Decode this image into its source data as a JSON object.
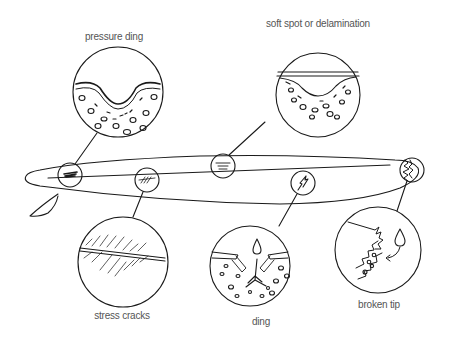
{
  "diagram": {
    "callouts": [
      {
        "id": "pressure-ding",
        "label": "pressure ding",
        "label_x": 114,
        "label_y": 31,
        "circle": {
          "cx": 118,
          "cy": 92,
          "r": 45
        },
        "board_point": {
          "cx": 70,
          "cy": 175
        }
      },
      {
        "id": "soft-spot",
        "label": "soft spot or delamination",
        "label_x": 318,
        "label_y": 18,
        "circle": {
          "cx": 318,
          "cy": 95,
          "r": 42
        },
        "board_point": {
          "cx": 223,
          "cy": 166
        }
      },
      {
        "id": "stress-cracks",
        "label": "stress cracks",
        "label_x": 122,
        "label_y": 310,
        "circle": {
          "cx": 123,
          "cy": 262,
          "r": 45
        },
        "board_point": {
          "cx": 147,
          "cy": 180
        }
      },
      {
        "id": "ding",
        "label": "ding",
        "label_x": 261,
        "label_y": 316,
        "circle": {
          "cx": 250,
          "cy": 266,
          "r": 40
        },
        "board_point": {
          "cx": 303,
          "cy": 183
        }
      },
      {
        "id": "broken-tip",
        "label": "broken tip",
        "label_x": 379,
        "label_y": 299,
        "circle": {
          "cx": 378,
          "cy": 250,
          "r": 43
        },
        "board_point": {
          "cx": 412,
          "cy": 170
        }
      }
    ],
    "colors": {
      "stroke": "#1a1a1a",
      "label": "#555555",
      "background": "#ffffff"
    }
  }
}
